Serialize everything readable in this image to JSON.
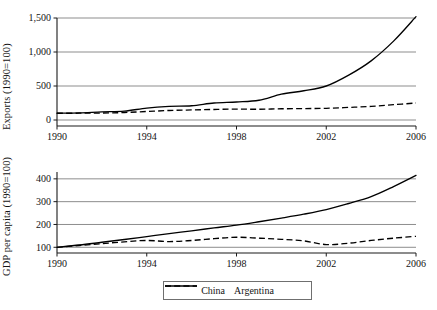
{
  "figure": {
    "legend": {
      "position": "bottom-center",
      "entries": [
        {
          "label": "China",
          "style": "solid",
          "color": "#000000"
        },
        {
          "label": "Argentina",
          "style": "dashed",
          "color": "#000000"
        }
      ]
    }
  },
  "chart_data": [
    {
      "type": "line",
      "title": "",
      "panel": "top",
      "xlabel": "",
      "ylabel": "Exports (1990=100)",
      "xlim": [
        1990,
        2006
      ],
      "ylim": [
        0,
        1500
      ],
      "xticks": [
        1990,
        1994,
        1998,
        2002,
        2006
      ],
      "xtick_labels": [
        "1990",
        "1994",
        "1998",
        "2002",
        "2006"
      ],
      "yticks": [
        0,
        500,
        1000,
        1500
      ],
      "ytick_labels": [
        "0",
        "500",
        "1,000",
        "1,500"
      ],
      "grid": true,
      "legend_position": "below-figure",
      "x": [
        1990,
        1991,
        1992,
        1993,
        1994,
        1995,
        1996,
        1997,
        1998,
        1999,
        2000,
        2001,
        2002,
        2003,
        2004,
        2005,
        2006
      ],
      "series": [
        {
          "name": "China",
          "style": "solid",
          "color": "#000000",
          "values": [
            100,
            105,
            120,
            130,
            175,
            200,
            210,
            250,
            265,
            290,
            380,
            430,
            500,
            660,
            870,
            1160,
            1520
          ]
        },
        {
          "name": "Argentina",
          "style": "dashed",
          "color": "#000000",
          "values": [
            100,
            100,
            102,
            110,
            125,
            140,
            148,
            155,
            160,
            158,
            165,
            168,
            172,
            185,
            200,
            225,
            250
          ]
        }
      ]
    },
    {
      "type": "line",
      "title": "",
      "panel": "bottom",
      "xlabel": "",
      "ylabel": "GDP per capita (1990=100)",
      "xlim": [
        1990,
        2006
      ],
      "ylim": [
        75,
        430
      ],
      "xticks": [
        1990,
        1994,
        1998,
        2002,
        2006
      ],
      "xtick_labels": [
        "1990",
        "1994",
        "1998",
        "2002",
        "2006"
      ],
      "yticks": [
        100,
        200,
        300,
        400
      ],
      "ytick_labels": [
        "100",
        "200",
        "300",
        "400"
      ],
      "grid": true,
      "legend_position": "below-figure",
      "x": [
        1990,
        1991,
        1992,
        1993,
        1994,
        1995,
        1996,
        1997,
        1998,
        1999,
        2000,
        2001,
        2002,
        2003,
        2004,
        2005,
        2006
      ],
      "series": [
        {
          "name": "China",
          "style": "solid",
          "color": "#000000",
          "values": [
            100,
            110,
            122,
            134,
            147,
            160,
            172,
            185,
            197,
            212,
            228,
            245,
            265,
            292,
            322,
            366,
            415
          ]
        },
        {
          "name": "Argentina",
          "style": "dashed",
          "color": "#000000",
          "values": [
            100,
            108,
            116,
            124,
            130,
            125,
            130,
            138,
            144,
            140,
            135,
            128,
            112,
            118,
            130,
            140,
            148
          ]
        }
      ]
    }
  ]
}
